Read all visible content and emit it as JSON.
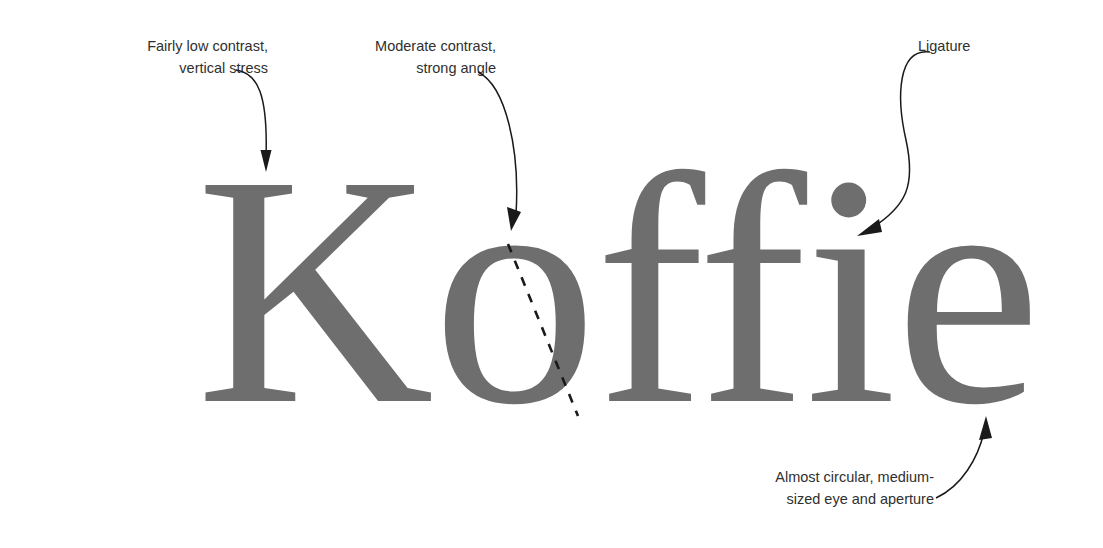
{
  "figure": {
    "type": "typography-annotation-diagram",
    "background_color": "#ffffff",
    "specimen_color": "#6e6e6e",
    "annotation_color": "#2f2f2f",
    "arrow_color": "#1a1a1a"
  },
  "specimen": {
    "word": "Koffie",
    "note": "serif typeface specimen with ffi ligature"
  },
  "annotations": [
    {
      "id": "contrast",
      "line1": "Fairly low contrast,",
      "line2": "vertical stress",
      "target": "K stem"
    },
    {
      "id": "angle",
      "line1": "Moderate contrast,",
      "line2": "strong angle",
      "target": "o stress axis"
    },
    {
      "id": "ligature",
      "line1": "Ligature",
      "line2": "",
      "target": "ffi ligature junction"
    },
    {
      "id": "aperture",
      "line1": "Almost circular, medium-",
      "line2": "sized eye and aperture",
      "target": "e bowl"
    }
  ]
}
